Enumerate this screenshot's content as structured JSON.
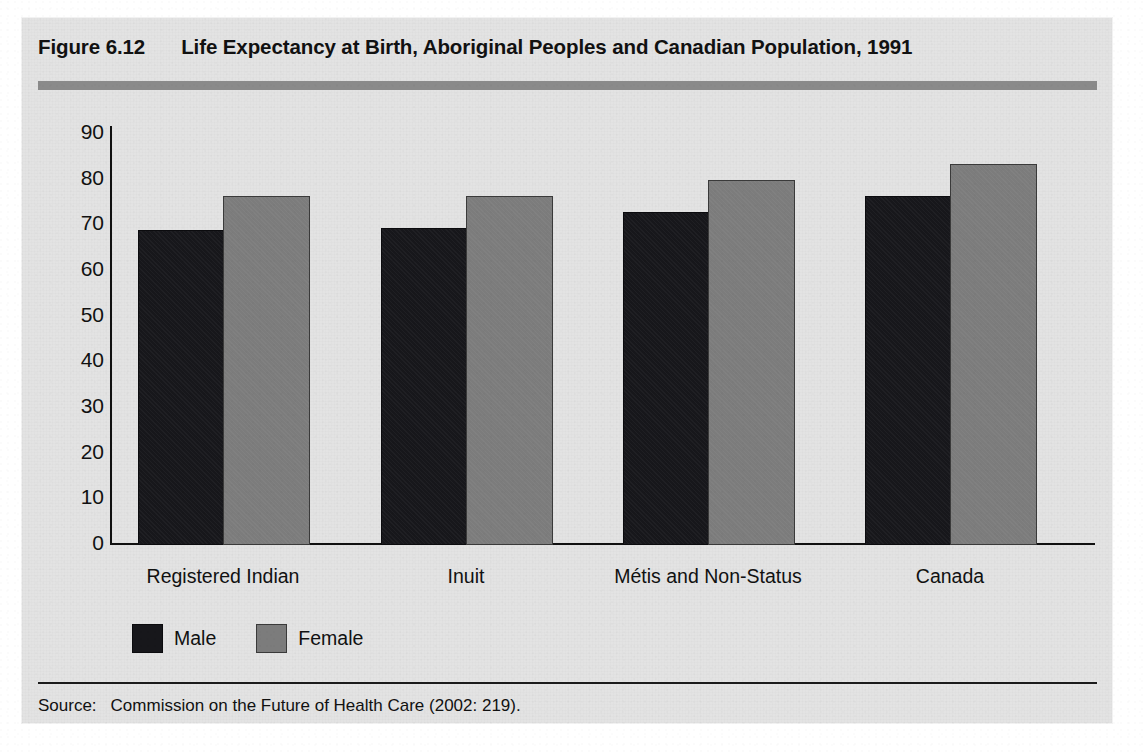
{
  "figure": {
    "number": "Figure 6.12",
    "title": "Life Expectancy at Birth, Aboriginal Peoples and Canadian Population, 1991",
    "source_label": "Source:",
    "source_text": "Commission on the Future of Health Care (2002: 219)."
  },
  "colors": {
    "panel_background": "#e3e3e3",
    "page_background": "#ffffff",
    "heading_rule": "#8a8a8a",
    "male_bar": "#17171b",
    "female_bar": "#7c7c7c",
    "axis": "#111111",
    "text": "#111111"
  },
  "legend": {
    "position": "bottom-left",
    "items": [
      {
        "label": "Male",
        "color": "#17171b",
        "swatch": "male-swatch"
      },
      {
        "label": "Female",
        "color": "#7c7c7c",
        "swatch": "female-swatch"
      }
    ]
  },
  "chart_data": {
    "type": "bar",
    "title": "Life Expectancy at Birth, Aboriginal Peoples and Canadian Population, 1991",
    "xlabel": "",
    "ylabel": "",
    "categories": [
      "Registered Indian",
      "Inuit",
      "Métis and Non-Status",
      "Canada"
    ],
    "series": [
      {
        "name": "Male",
        "color": "#17171b",
        "values": [
          68.5,
          69.0,
          72.5,
          76.0
        ]
      },
      {
        "name": "Female",
        "color": "#7c7c7c",
        "values": [
          76.0,
          76.0,
          79.5,
          83.0
        ]
      }
    ],
    "ylim": [
      0,
      90
    ],
    "yticks": [
      0,
      10,
      20,
      30,
      40,
      50,
      60,
      70,
      80,
      90
    ],
    "ytick_labels": [
      "0",
      "10",
      "20",
      "30",
      "40",
      "50",
      "60",
      "70",
      "80",
      "90"
    ],
    "grid": false,
    "legend_position": "bottom-left",
    "units": "years"
  }
}
